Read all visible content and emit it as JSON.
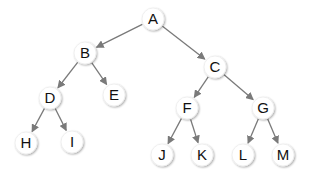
{
  "diagram": {
    "type": "binary-tree",
    "edge_color": "#7a7a7a",
    "node_fill": "#ffffff",
    "node_shadow": "#d6d6d6",
    "text_color": "#111111",
    "node_radius": 11,
    "nodes": [
      {
        "id": "A",
        "label": "A",
        "x": 153,
        "y": 19
      },
      {
        "id": "B",
        "label": "B",
        "x": 85,
        "y": 53
      },
      {
        "id": "C",
        "label": "C",
        "x": 215,
        "y": 67
      },
      {
        "id": "D",
        "label": "D",
        "x": 50,
        "y": 98
      },
      {
        "id": "E",
        "label": "E",
        "x": 114,
        "y": 95
      },
      {
        "id": "F",
        "label": "F",
        "x": 187,
        "y": 108
      },
      {
        "id": "G",
        "label": "G",
        "x": 263,
        "y": 108
      },
      {
        "id": "H",
        "label": "H",
        "x": 26,
        "y": 143
      },
      {
        "id": "I",
        "label": "I",
        "x": 72,
        "y": 142
      },
      {
        "id": "J",
        "label": "J",
        "x": 162,
        "y": 155
      },
      {
        "id": "K",
        "label": "K",
        "x": 202,
        "y": 155
      },
      {
        "id": "L",
        "label": "L",
        "x": 243,
        "y": 155
      },
      {
        "id": "M",
        "label": "M",
        "x": 283,
        "y": 155
      }
    ],
    "edges": [
      {
        "from": "A",
        "to": "B"
      },
      {
        "from": "A",
        "to": "C"
      },
      {
        "from": "B",
        "to": "D"
      },
      {
        "from": "B",
        "to": "E"
      },
      {
        "from": "C",
        "to": "F"
      },
      {
        "from": "C",
        "to": "G"
      },
      {
        "from": "D",
        "to": "H"
      },
      {
        "from": "D",
        "to": "I"
      },
      {
        "from": "F",
        "to": "J"
      },
      {
        "from": "F",
        "to": "K"
      },
      {
        "from": "G",
        "to": "L"
      },
      {
        "from": "G",
        "to": "M"
      }
    ]
  }
}
